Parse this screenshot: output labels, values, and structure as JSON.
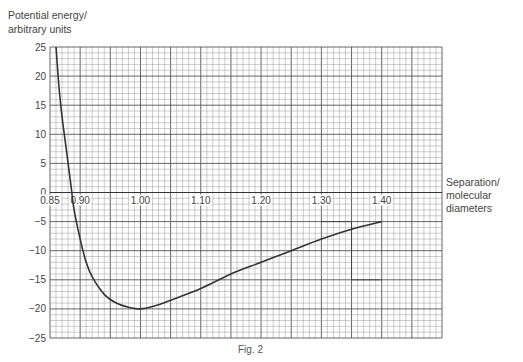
{
  "chart_data": {
    "type": "line",
    "title": "",
    "caption": "Fig. 2",
    "ylabel_lines": [
      "Potential energy/",
      "arbitrary units"
    ],
    "xlabel_lines": [
      "Separation/",
      "molecular",
      "diameters"
    ],
    "xlim": [
      0.85,
      1.5
    ],
    "ylim": [
      -25,
      25
    ],
    "x_ticks": [
      "0.85",
      "0.90",
      "1.00",
      "1.10",
      "1.20",
      "1.30",
      "1.40"
    ],
    "x_tick_values": [
      0.85,
      0.9,
      1.0,
      1.1,
      1.2,
      1.3,
      1.4
    ],
    "y_ticks": [
      "25",
      "20",
      "15",
      "10",
      "5",
      "0",
      "−5",
      "−10",
      "−15",
      "−20",
      "−25"
    ],
    "y_tick_values": [
      25,
      20,
      15,
      10,
      5,
      0,
      -5,
      -10,
      -15,
      -20,
      -25
    ],
    "grid": true,
    "grid_minor_x": 0.01,
    "grid_minor_y": 1,
    "grid_major_every": 5,
    "series": [
      {
        "name": "Potential energy curve",
        "color": "#333333",
        "x": [
          0.86,
          0.865,
          0.87,
          0.875,
          0.88,
          0.885,
          0.89,
          0.9,
          0.91,
          0.92,
          0.94,
          0.96,
          0.98,
          1.0,
          1.02,
          1.05,
          1.1,
          1.15,
          1.2,
          1.25,
          1.3,
          1.35,
          1.4
        ],
        "y": [
          25,
          18,
          13,
          9,
          5,
          1,
          -3,
          -8,
          -12,
          -14.5,
          -17.5,
          -19,
          -19.7,
          -20,
          -19.6,
          -18.5,
          -16.5,
          -14,
          -12,
          -10,
          -8,
          -6.3,
          -5
        ]
      }
    ],
    "annotations": [
      {
        "type": "construction-lines",
        "desc": "right-angle construction near x 1.30-1.40, y -5 to -15"
      }
    ]
  }
}
